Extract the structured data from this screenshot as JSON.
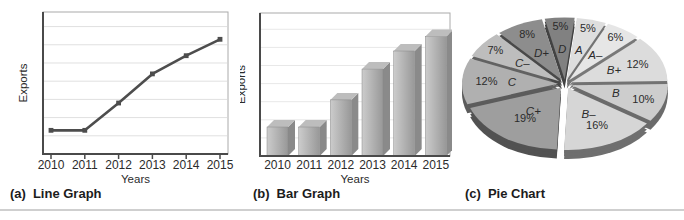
{
  "page": {
    "background": "#ffffff",
    "divider_color": "#cfcfcf"
  },
  "captions": [
    {
      "prefix": "(a)",
      "label": "Line Graph"
    },
    {
      "prefix": "(b)",
      "label": "Bar Graph"
    },
    {
      "prefix": "(c)",
      "label": "Pie Chart"
    }
  ],
  "colors": {
    "axis": "#4a4a4a",
    "frame": "#aaaaaa",
    "grid": "#e0e0e0",
    "grid_faint": "#e8e8e8",
    "text": "#2b2b2b",
    "line_series": "#4d4d4d",
    "bar_front_light": "#cccccc",
    "bar_front_dark": "#989898",
    "bar_side": "#8a8a8a",
    "bar_top": "#bdbdbd"
  },
  "chart_data": [
    {
      "type": "line",
      "title": "",
      "xlabel": "Years",
      "ylabel": "Exports",
      "categories": [
        "2010",
        "2011",
        "2012",
        "2013",
        "2014",
        "2015"
      ],
      "values": [
        1.3,
        1.3,
        2.8,
        4.4,
        5.4,
        6.3
      ],
      "ylim": [
        0,
        7.8
      ],
      "y_axis_ticks_labeled": false,
      "units": "relative (y axis unlabeled in source)",
      "grid": "horizontal",
      "gridline_count": 7,
      "legend": "none"
    },
    {
      "type": "bar",
      "title": "",
      "xlabel": "Years",
      "ylabel": "Exports",
      "categories": [
        "2010",
        "2011",
        "2012",
        "2013",
        "2014",
        "2015"
      ],
      "values": [
        1.6,
        1.6,
        3.1,
        4.8,
        5.8,
        6.6
      ],
      "ylim": [
        0,
        7.9
      ],
      "y_axis_ticks_labeled": false,
      "units": "relative (y axis unlabeled in source)",
      "grid": "horizontal",
      "gridline_count": 7,
      "style_3d": true,
      "legend": "none"
    },
    {
      "type": "pie",
      "title": "",
      "style_3d": true,
      "exploded": true,
      "direction": "clockwise",
      "start_angle_deg_from_top": -12,
      "slices": [
        {
          "label": "D",
          "value": 5,
          "percent_label": "5%",
          "color": "#818181"
        },
        {
          "label": "A",
          "value": 5,
          "percent_label": "5%",
          "color": "#dedede"
        },
        {
          "label": "A–",
          "value": 6,
          "percent_label": "6%",
          "color": "#e6e6e6"
        },
        {
          "label": "B+",
          "value": 12,
          "percent_label": "12%",
          "color": "#dcdcdc"
        },
        {
          "label": "B",
          "value": 10,
          "percent_label": "10%",
          "color": "#cdcdcd"
        },
        {
          "label": "B–",
          "value": 16,
          "percent_label": "16%",
          "color": "#d6d6d6"
        },
        {
          "label": "C+",
          "value": 19,
          "percent_label": "19%",
          "color": "#9e9e9e"
        },
        {
          "label": "C",
          "value": 12,
          "percent_label": "12%",
          "color": "#b0b0b0"
        },
        {
          "label": "C–",
          "value": 7,
          "percent_label": "7%",
          "color": "#bdbdbd"
        },
        {
          "label": "D+",
          "value": 8,
          "percent_label": "8%",
          "color": "#8d8d8d"
        }
      ]
    }
  ]
}
